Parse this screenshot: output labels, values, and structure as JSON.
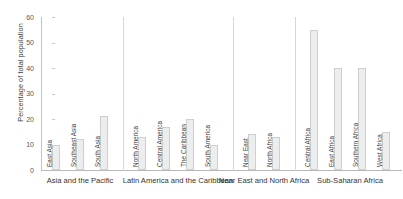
{
  "chart_data": {
    "type": "bar",
    "title": "",
    "xlabel": "",
    "ylabel": "Percentage of total population",
    "ylim": [
      0,
      60
    ],
    "yticks": [
      0,
      10,
      20,
      30,
      40,
      50,
      60
    ],
    "grid": false,
    "legend": "none",
    "bar_color": "#ededed",
    "bar_border_color": "#cfcfcf",
    "groups": [
      {
        "name": "Asia and the Pacific",
        "categories": [
          "East Asia",
          "Southeast Asia",
          "South Asia"
        ],
        "values": [
          10,
          12,
          21
        ]
      },
      {
        "name": "Latin America and the Caribbean",
        "categories": [
          "North America",
          "Central America",
          "The Caribbean",
          "South America"
        ],
        "values": [
          13,
          17,
          20,
          10
        ]
      },
      {
        "name": "Near East and North Africa",
        "categories": [
          "Near East",
          "North Africa"
        ],
        "values": [
          14,
          13
        ]
      },
      {
        "name": "Sub-Saharan Africa",
        "categories": [
          "Central Africa",
          "East Africa",
          "Southern Africa",
          "West Africa"
        ],
        "values": [
          55,
          40,
          40,
          15
        ]
      }
    ],
    "categories": [
      "East Asia",
      "Southeast Asia",
      "South Asia",
      "North America",
      "Central America",
      "The Caribbean",
      "South America",
      "Near East",
      "North Africa",
      "Central Africa",
      "East Africa",
      "Southern Africa",
      "West Africa"
    ],
    "values": [
      10,
      12,
      21,
      13,
      17,
      20,
      10,
      14,
      13,
      55,
      40,
      40,
      15
    ]
  }
}
